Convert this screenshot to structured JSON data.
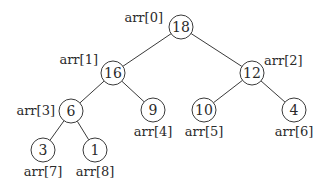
{
  "diagram": {
    "type": "binary-heap-tree",
    "nodes": [
      {
        "index": 0,
        "value": "18",
        "label": "arr[0]",
        "label_side": "left"
      },
      {
        "index": 1,
        "value": "16",
        "label": "arr[1]",
        "label_side": "upper-left"
      },
      {
        "index": 2,
        "value": "12",
        "label": "arr[2]",
        "label_side": "upper-right"
      },
      {
        "index": 3,
        "value": "6",
        "label": "arr[3]",
        "label_side": "left"
      },
      {
        "index": 4,
        "value": "9",
        "label": "arr[4]",
        "label_side": "below"
      },
      {
        "index": 5,
        "value": "10",
        "label": "arr[5]",
        "label_side": "below"
      },
      {
        "index": 6,
        "value": "4",
        "label": "arr[6]",
        "label_side": "below"
      },
      {
        "index": 7,
        "value": "3",
        "label": "arr[7]",
        "label_side": "below"
      },
      {
        "index": 8,
        "value": "1",
        "label": "arr[8]",
        "label_side": "below"
      }
    ],
    "edges": [
      [
        0,
        1
      ],
      [
        0,
        2
      ],
      [
        1,
        3
      ],
      [
        1,
        4
      ],
      [
        2,
        5
      ],
      [
        2,
        6
      ],
      [
        3,
        7
      ],
      [
        3,
        8
      ]
    ]
  }
}
